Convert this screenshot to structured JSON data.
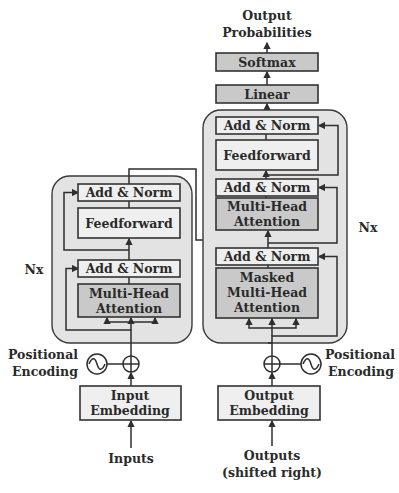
{
  "diagram": {
    "output_label": [
      "Output",
      "Probabilities"
    ],
    "head": {
      "softmax": "Softmax",
      "linear": "Linear"
    },
    "encoder": {
      "repeat_label": "Nx",
      "blocks": [
        {
          "id": "enc-add-norm-2",
          "label": "Add & Norm",
          "style": "light"
        },
        {
          "id": "enc-feedforward",
          "label": "Feedforward",
          "style": "light"
        },
        {
          "id": "enc-add-norm-1",
          "label": "Add & Norm",
          "style": "light"
        },
        {
          "id": "enc-attention",
          "label": [
            "Multi-Head",
            "Attention"
          ],
          "style": "dark"
        }
      ],
      "positional_encoding_label": [
        "Positional",
        "Encoding"
      ],
      "embedding_label": [
        "Input",
        "Embedding"
      ],
      "input_label": "Inputs"
    },
    "decoder": {
      "repeat_label": "Nx",
      "blocks": [
        {
          "id": "dec-add-norm-3",
          "label": "Add & Norm",
          "style": "light"
        },
        {
          "id": "dec-feedforward",
          "label": "Feedforward",
          "style": "light"
        },
        {
          "id": "dec-add-norm-2",
          "label": "Add & Norm",
          "style": "light"
        },
        {
          "id": "dec-cross-attention",
          "label": [
            "Multi-Head",
            "Attention"
          ],
          "style": "dark"
        },
        {
          "id": "dec-add-norm-1",
          "label": "Add & Norm",
          "style": "light"
        },
        {
          "id": "dec-masked-attention",
          "label": [
            "Masked",
            "Multi-Head",
            "Attention"
          ],
          "style": "dark"
        }
      ],
      "positional_encoding_label": [
        "Positional",
        "Encoding"
      ],
      "embedding_label": [
        "Output",
        "Embedding"
      ],
      "input_label": [
        "Outputs",
        "(shifted right)"
      ]
    },
    "colors": {
      "stack_fill": "#e3e3e3",
      "light_box_fill": "#efefef",
      "dark_box_fill": "#c9c9c9",
      "stroke": "#333333",
      "text": "#2a2a2a"
    }
  }
}
